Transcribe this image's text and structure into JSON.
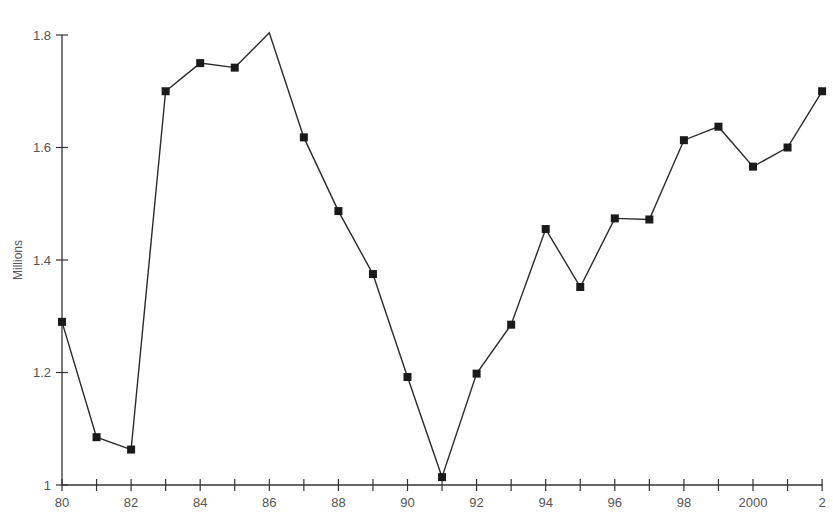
{
  "chart_data": {
    "type": "line",
    "title": "",
    "xlabel": "",
    "ylabel": "Millions",
    "ylim": [
      1.0,
      1.8
    ],
    "grid": false,
    "legend": null,
    "x": [
      "80",
      "81",
      "82",
      "83",
      "84",
      "85",
      "86",
      "87",
      "88",
      "89",
      "90",
      "91",
      "92",
      "93",
      "94",
      "95",
      "96",
      "97",
      "98",
      "99",
      "2000",
      "01",
      "02"
    ],
    "x_tick_labels": [
      "80",
      "82",
      "84",
      "86",
      "88",
      "90",
      "92",
      "94",
      "96",
      "98",
      "2000",
      "2"
    ],
    "y_tick_labels": [
      "1",
      "1.2",
      "1.4",
      "1.6",
      "1.8"
    ],
    "series": [
      {
        "name": "Millions",
        "marker": "square",
        "values": [
          1.29,
          1.085,
          1.063,
          1.7,
          1.75,
          1.742,
          1.804,
          1.618,
          1.487,
          1.375,
          1.192,
          1.014,
          1.198,
          1.285,
          1.455,
          1.352,
          1.474,
          1.472,
          1.613,
          1.637,
          1.566,
          1.6,
          1.7
        ]
      }
    ],
    "markers_on": [
      true,
      true,
      true,
      true,
      true,
      true,
      false,
      true,
      true,
      true,
      true,
      true,
      true,
      true,
      true,
      true,
      true,
      true,
      true,
      true,
      true,
      true,
      true
    ]
  },
  "style": {
    "line_color": "#2a2a2a",
    "marker_color": "#1a1a1a",
    "axis_color": "#333333"
  }
}
